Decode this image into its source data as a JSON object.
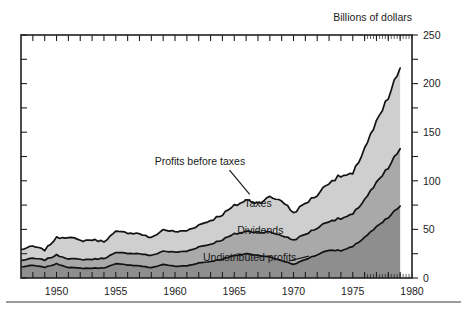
{
  "chart_data": {
    "type": "area",
    "stacked": true,
    "title": "",
    "unit_label": "Billions of dollars",
    "xlabel": "",
    "ylabel": "",
    "xlim": [
      1947,
      1980
    ],
    "ylim": [
      0,
      250
    ],
    "yticks": [
      0,
      50,
      100,
      150,
      200,
      250
    ],
    "ytick_labels": [
      "0",
      "50",
      "100",
      "150",
      "200",
      "250"
    ],
    "xticks": [
      1950,
      1955,
      1960,
      1965,
      1970,
      1975,
      1980
    ],
    "xtick_labels": [
      "1950",
      "1955",
      "1960",
      "1965",
      "1970",
      "1975",
      "1980"
    ],
    "grid": false,
    "legend": "inline-annotations",
    "annotations": [
      {
        "name": "profits-before-taxes",
        "text": "Profits before taxes",
        "x": 1962.1,
        "y": 116.0
      },
      {
        "name": "taxes",
        "text": "Taxes",
        "x": 1967.0,
        "y": 73.0
      },
      {
        "name": "dividends",
        "text": "Dividends",
        "x": 1967.2,
        "y": 45.0
      },
      {
        "name": "undistributed-profits",
        "text": "Undistributed  profits",
        "x": 1966.3,
        "y": 18.0
      }
    ],
    "x": [
      1947,
      1948,
      1949,
      1950,
      1951,
      1952,
      1953,
      1954,
      1955,
      1956,
      1957,
      1958,
      1959,
      1960,
      1961,
      1962,
      1963,
      1964,
      1965,
      1966,
      1967,
      1968,
      1969,
      1970,
      1971,
      1972,
      1973,
      1974,
      1975,
      1976,
      1977,
      1978,
      1979
    ],
    "series": [
      {
        "name": "Undistributed profits",
        "color": "#8e8e8e",
        "values": [
          11.5,
          13.0,
          11.0,
          14.5,
          11.0,
          10.0,
          10.0,
          10.5,
          14.5,
          13.5,
          12.5,
          10.5,
          14.0,
          12.0,
          12.5,
          15.5,
          17.0,
          19.5,
          23.0,
          25.0,
          23.5,
          21.5,
          18.0,
          14.0,
          19.0,
          24.0,
          29.0,
          28.0,
          32.0,
          42.0,
          52.0,
          62.0,
          74.0
        ]
      },
      {
        "name": "Dividends",
        "color": "#a9a9a9",
        "values": [
          6.5,
          7.2,
          7.5,
          9.0,
          9.0,
          9.0,
          9.2,
          9.8,
          11.2,
          12.1,
          12.6,
          12.4,
          13.7,
          14.5,
          15.0,
          16.5,
          17.8,
          20.0,
          22.0,
          23.0,
          24.0,
          25.5,
          26.0,
          25.0,
          26.0,
          27.5,
          30.0,
          33.0,
          33.0,
          39.0,
          45.0,
          51.0,
          59.0
        ]
      },
      {
        "name": "Taxes",
        "color": "#cfcfcf",
        "values": [
          11.3,
          12.4,
          10.3,
          17.8,
          22.4,
          19.3,
          20.1,
          17.4,
          21.7,
          21.1,
          20.6,
          18.2,
          22.0,
          21.0,
          21.2,
          22.5,
          24.4,
          26.0,
          29.0,
          32.0,
          30.0,
          36.0,
          36.0,
          28.0,
          32.0,
          34.0,
          40.0,
          44.0,
          41.0,
          53.0,
          62.0,
          72.0,
          83.0
        ]
      }
    ],
    "top_boundary_name": "Profits before taxes",
    "peak_value": 235,
    "peak_year": 1979
  }
}
